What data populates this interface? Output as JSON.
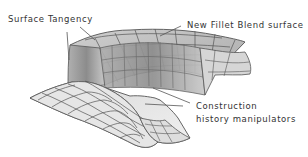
{
  "diagram": {
    "labels": {
      "surface_tangency": "Surface Tangency",
      "new_fillet_blend": "New Fillet Blend surface",
      "construction_line1": "Construction",
      "construction_line2": "history manipulators"
    },
    "colors": {
      "surface_light": "#e4e4e4",
      "surface_mid": "#bdbdbd",
      "surface_dark": "#8a8a8a",
      "grid": "#555555",
      "leader": "#555555",
      "text": "#333333"
    }
  }
}
